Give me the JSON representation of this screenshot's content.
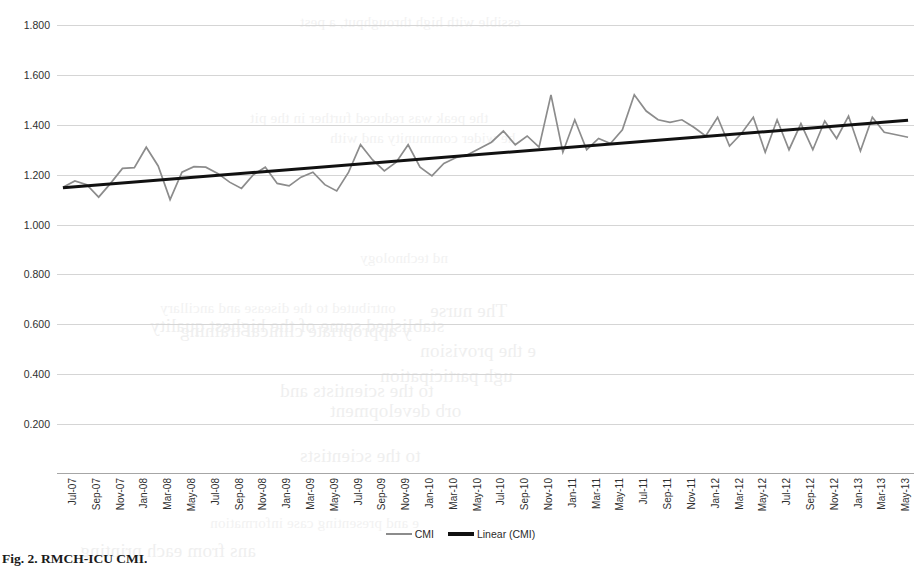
{
  "figure": {
    "caption": "Fig. 2. RMCH-ICU CMI.",
    "legend": [
      {
        "label": "CMI",
        "icon": "line-swatch-gray",
        "color": "#8c8c8c"
      },
      {
        "label": "Linear (CMI)",
        "icon": "line-swatch-black",
        "color": "#111111"
      }
    ]
  },
  "bleed_text": [
    {
      "text": "essible with high throughput, a pest",
      "x": 300,
      "y": 14,
      "size": 15
    },
    {
      "text": "the peak was reduced further in the pit",
      "x": 250,
      "y": 110,
      "size": 15
    },
    {
      "text": "he wider community and with",
      "x": 330,
      "y": 130,
      "size": 15
    },
    {
      "text": "nd technology",
      "x": 360,
      "y": 250,
      "size": 15
    },
    {
      "text": "The nurse",
      "x": 430,
      "y": 300,
      "size": 19
    },
    {
      "text": "ontributed to the disease and ancillary",
      "x": 160,
      "y": 300,
      "size": 15
    },
    {
      "text": "stablished some of the highest quality",
      "x": 150,
      "y": 315,
      "size": 19
    },
    {
      "text": "y appropriate clinical training",
      "x": 180,
      "y": 320,
      "size": 19
    },
    {
      "text": "e the provision",
      "x": 420,
      "y": 340,
      "size": 19
    },
    {
      "text": "ugh participation",
      "x": 380,
      "y": 365,
      "size": 19
    },
    {
      "text": "to the scientists and",
      "x": 280,
      "y": 380,
      "size": 19
    },
    {
      "text": "orb development",
      "x": 330,
      "y": 400,
      "size": 19
    },
    {
      "text": "to the scientists",
      "x": 300,
      "y": 445,
      "size": 19
    },
    {
      "text": "e and presenting case information",
      "x": 210,
      "y": 515,
      "size": 15
    },
    {
      "text": "ans from each printing",
      "x": 80,
      "y": 540,
      "size": 19
    }
  ],
  "chart_data": {
    "type": "line",
    "title": "",
    "xlabel": "",
    "ylabel": "",
    "ylim": [
      0.0,
      1.8
    ],
    "yticks": [
      "0.200",
      "0.400",
      "0.600",
      "0.800",
      "1.000",
      "1.200",
      "1.400",
      "1.600",
      "1.800"
    ],
    "ytick_values": [
      0.2,
      0.4,
      0.6,
      0.8,
      1.0,
      1.2,
      1.4,
      1.6,
      1.8
    ],
    "grid": true,
    "legend_position": "bottom",
    "xtick_labels": [
      "Jul-07",
      "Sep-07",
      "Nov-07",
      "Jan-08",
      "Mar-08",
      "May-08",
      "Jul-08",
      "Sep-08",
      "Nov-08",
      "Jan-09",
      "Mar-09",
      "May-09",
      "Jul-09",
      "Sep-09",
      "Nov-09",
      "Jan-10",
      "Mar-10",
      "May-10",
      "Jul-10",
      "Sep-10",
      "Nov-10",
      "Jan-11",
      "Mar-11",
      "May-11",
      "Jul-11",
      "Sep-11",
      "Nov-11",
      "Jan-12",
      "Mar-12",
      "May-12",
      "Jul-12",
      "Sep-12",
      "Nov-12",
      "Jan-13",
      "Mar-13",
      "May-13"
    ],
    "x": [
      "Jul-07",
      "Aug-07",
      "Sep-07",
      "Oct-07",
      "Nov-07",
      "Dec-07",
      "Jan-08",
      "Feb-08",
      "Mar-08",
      "Apr-08",
      "May-08",
      "Jun-08",
      "Jul-08",
      "Aug-08",
      "Sep-08",
      "Oct-08",
      "Nov-08",
      "Dec-08",
      "Jan-09",
      "Feb-09",
      "Mar-09",
      "Apr-09",
      "May-09",
      "Jun-09",
      "Jul-09",
      "Aug-09",
      "Sep-09",
      "Oct-09",
      "Nov-09",
      "Dec-09",
      "Jan-10",
      "Feb-10",
      "Mar-10",
      "Apr-10",
      "May-10",
      "Jun-10",
      "Jul-10",
      "Aug-10",
      "Sep-10",
      "Oct-10",
      "Nov-10",
      "Dec-10",
      "Jan-11",
      "Feb-11",
      "Mar-11",
      "Apr-11",
      "May-11",
      "Jun-11",
      "Jul-11",
      "Aug-11",
      "Sep-11",
      "Oct-11",
      "Nov-11",
      "Dec-11",
      "Jan-12",
      "Feb-12",
      "Mar-12",
      "Apr-12",
      "May-12",
      "Jun-12",
      "Jul-12",
      "Aug-12",
      "Sep-12",
      "Oct-12",
      "Nov-12",
      "Dec-12",
      "Jan-13",
      "Feb-13",
      "Mar-13",
      "Apr-13",
      "May-13",
      "Jun-13"
    ],
    "series": [
      {
        "name": "CMI",
        "color": "#8c8c8c",
        "values": [
          1.15,
          1.175,
          1.16,
          1.11,
          1.165,
          1.225,
          1.228,
          1.31,
          1.235,
          1.1,
          1.21,
          1.232,
          1.23,
          1.205,
          1.17,
          1.145,
          1.2,
          1.23,
          1.165,
          1.155,
          1.19,
          1.21,
          1.16,
          1.135,
          1.21,
          1.32,
          1.26,
          1.215,
          1.25,
          1.32,
          1.23,
          1.195,
          1.245,
          1.268,
          1.28,
          1.305,
          1.33,
          1.375,
          1.32,
          1.355,
          1.31,
          1.52,
          1.29,
          1.42,
          1.3,
          1.345,
          1.325,
          1.38,
          1.52,
          1.455,
          1.42,
          1.41,
          1.42,
          1.39,
          1.355,
          1.43,
          1.315,
          1.365,
          1.43,
          1.29,
          1.42,
          1.3,
          1.405,
          1.3,
          1.415,
          1.345,
          1.435,
          1.295,
          1.43,
          1.37,
          1.36,
          1.35
        ]
      },
      {
        "name": "Linear (CMI)",
        "color": "#111111",
        "type": "trendline",
        "start_value": 1.148,
        "end_value": 1.418
      }
    ]
  }
}
